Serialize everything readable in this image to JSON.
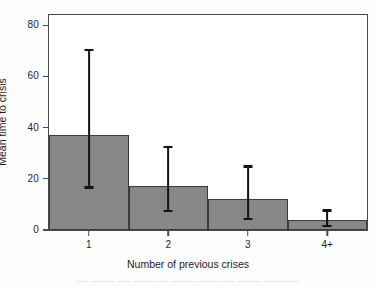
{
  "chart_data": {
    "type": "bar",
    "title": "",
    "subtitle": "",
    "xlabel": "Number of previous crises",
    "ylabel": "Mean time to crisis",
    "categories": [
      "1",
      "2",
      "3",
      "4+"
    ],
    "values": [
      37.2,
      17.3,
      12.1,
      3.8
    ],
    "error_bars": {
      "lower": [
        16.6,
        7.3,
        4.2,
        1.5
      ],
      "upper": [
        70.2,
        32.4,
        24.8,
        7.6
      ]
    },
    "ylim": [
      0,
      84
    ],
    "yticks": [
      0,
      20,
      40,
      60,
      80
    ],
    "ytick_labels": [
      "0",
      "20",
      "40",
      "60",
      "80"
    ],
    "xticks": [
      1,
      2,
      3,
      4
    ],
    "xtick_labels": [
      "1",
      "2",
      "3",
      "4+"
    ],
    "grid": false,
    "legend": null,
    "bar_color": "#878787",
    "bar_edge_color": "#3c3c3c",
    "error_color": "#131313",
    "axis_color": "#4a4a4a",
    "background_color": "#ffffff"
  },
  "artifact": {
    "bottom_text": "—  ——  — ———  —— ——— —— ———"
  }
}
